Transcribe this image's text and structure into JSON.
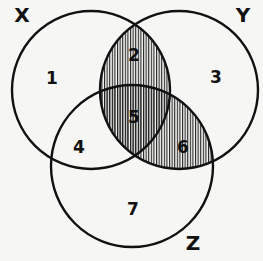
{
  "diagram": {
    "type": "venn-3",
    "sets": [
      {
        "id": "X",
        "label": "X",
        "cx": 91,
        "cy": 90,
        "r": 79,
        "label_pos": [
          22,
          15
        ]
      },
      {
        "id": "Y",
        "label": "Y",
        "cx": 179,
        "cy": 90,
        "r": 79,
        "label_pos": [
          243,
          15
        ]
      },
      {
        "id": "Z",
        "label": "Z",
        "cx": 132,
        "cy": 166,
        "r": 81,
        "label_pos": [
          193,
          243
        ]
      }
    ],
    "regions": [
      {
        "id": "1",
        "label": "1",
        "pos": [
          52,
          78
        ],
        "shaded": false
      },
      {
        "id": "2",
        "label": "2",
        "pos": [
          134,
          55
        ],
        "shaded": true
      },
      {
        "id": "3",
        "label": "3",
        "pos": [
          216,
          77
        ],
        "shaded": false
      },
      {
        "id": "4",
        "label": "4",
        "pos": [
          79,
          147
        ],
        "shaded": false
      },
      {
        "id": "5",
        "label": "5",
        "pos": [
          134,
          117
        ],
        "shaded": true
      },
      {
        "id": "6",
        "label": "6",
        "pos": [
          183,
          147
        ],
        "shaded": true
      },
      {
        "id": "7",
        "label": "7",
        "pos": [
          133,
          209
        ],
        "shaded": false
      }
    ],
    "shaded_regions": [
      "2",
      "5",
      "6"
    ],
    "shaded_expression": "Y ∩ (X ∪ Z)",
    "colors": {
      "stroke": "#111111",
      "hatch": "#222222",
      "background": "#f6f6f4"
    }
  }
}
